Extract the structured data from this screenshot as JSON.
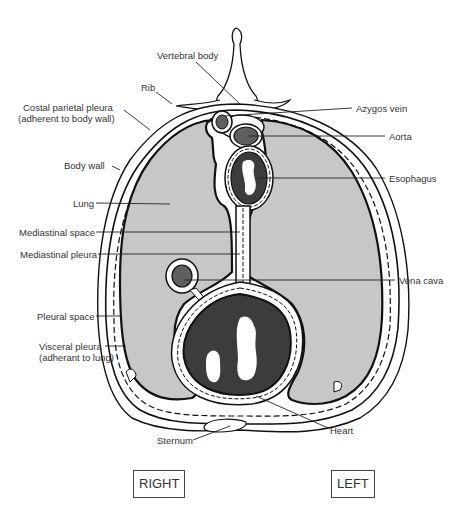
{
  "colors": {
    "lung": "#c7c7c7",
    "heart": "#3c3c3c",
    "vessel": "#5f5f5f",
    "outline": "#111111",
    "background": "#ffffff"
  },
  "labels": {
    "vertebral_body": "Vertebral body",
    "rib": "Rib",
    "costal_parietal_pleura_1": "Costal parietal pleura",
    "costal_parietal_pleura_2": "(adherent to  body wall)",
    "body_wall": "Body wall",
    "lung": "Lung",
    "mediastinal_space": "Mediastinal space",
    "mediastinal_pleura": "Mediastinal pleura",
    "pleural_space": "Pleural space",
    "visceral_pleura_1": "Visceral pleura",
    "visceral_pleura_2": "(adherant to lung)",
    "sternum": "Sternum",
    "azygos_vein": "Azygos vein",
    "aorta": "Aorta",
    "esophagus": "Esophagus",
    "vena_cava": "Vena cava",
    "heart": "Heart"
  },
  "orientation": {
    "right": "RIGHT",
    "left": "LEFT"
  }
}
